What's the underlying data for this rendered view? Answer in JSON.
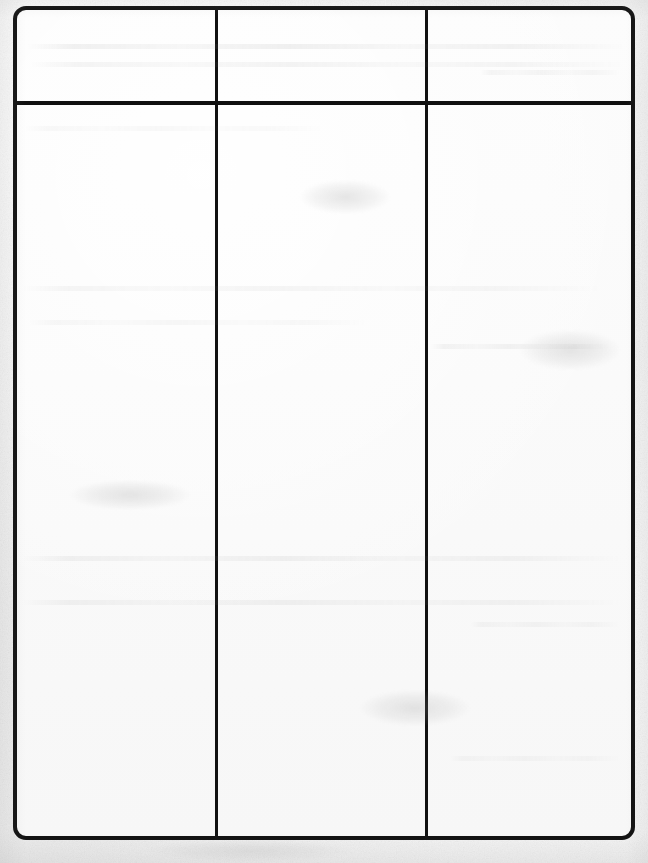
{
  "document": {
    "kind": "scanned-blank-form",
    "description": "Scanned sheet of paper with a hand-drawn blank three-column table",
    "page_background_color": "#f1f1f1",
    "paper_color": "#fbfbfb",
    "ink_color": "#101010"
  },
  "table": {
    "border_color": "#101010",
    "border_width_px": 4,
    "corner_radius_px": 13,
    "divider_color": "#111111",
    "divider_width_px": 3,
    "column_count": 3,
    "row_count": 1,
    "has_header_row": true,
    "headers": [
      "",
      "",
      ""
    ],
    "rows": [
      [
        "",
        "",
        ""
      ]
    ]
  },
  "annotations": {
    "ghost_text_note": "Faint bleed-through from the reverse side of the sheet; no legible characters",
    "legible_text_present": false
  }
}
